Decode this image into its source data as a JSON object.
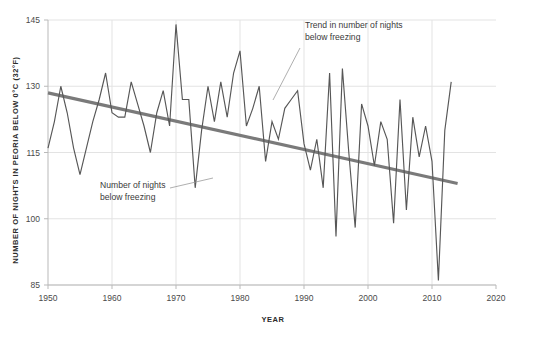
{
  "chart_data": {
    "type": "line",
    "title": "",
    "subtitle": "",
    "xlabel": "YEAR",
    "ylabel": "NUMBER OF NIGHTS IN PEORIA BELOW 0°C (32°F)",
    "xlim": [
      1950,
      2020
    ],
    "ylim": [
      85,
      145
    ],
    "xticks": [
      1950,
      1960,
      1970,
      1980,
      1990,
      2000,
      2010,
      2020
    ],
    "xtick_labels": [
      "1950",
      "1960",
      "1970",
      "1980",
      "1990",
      "2000",
      "2010",
      "2020"
    ],
    "yticks": [
      85,
      100,
      115,
      130,
      145
    ],
    "ytick_labels": [
      "85",
      "100",
      "115",
      "130",
      "145"
    ],
    "grid": "horizontal-and-vertical-light",
    "legend_position": "none",
    "series": [
      {
        "name": "Number of nights below freezing",
        "color": "#575757",
        "x": [
          1950,
          1951,
          1952,
          1953,
          1954,
          1955,
          1956,
          1957,
          1958,
          1959,
          1960,
          1961,
          1962,
          1963,
          1964,
          1965,
          1966,
          1967,
          1968,
          1969,
          1970,
          1971,
          1972,
          1973,
          1974,
          1975,
          1976,
          1977,
          1978,
          1979,
          1980,
          1981,
          1982,
          1983,
          1984,
          1985,
          1986,
          1987,
          1988,
          1989,
          1990,
          1991,
          1992,
          1993,
          1994,
          1995,
          1996,
          1997,
          1998,
          1999,
          2000,
          2001,
          2002,
          2003,
          2004,
          2005,
          2006,
          2007,
          2008,
          2009,
          2010,
          2011,
          2012,
          2013
        ],
        "y": [
          116,
          122,
          130,
          124,
          116,
          110,
          116,
          122,
          127,
          133,
          124,
          123,
          123,
          131,
          126,
          121,
          115,
          124,
          129,
          121,
          144,
          127,
          127,
          107,
          120,
          130,
          122,
          131,
          123,
          133,
          138,
          121,
          125,
          130,
          113,
          122,
          118,
          125,
          127,
          129,
          117,
          111,
          118,
          107,
          133,
          96,
          134,
          115,
          98,
          126,
          121,
          112,
          122,
          118,
          99,
          127,
          102,
          123,
          114,
          121,
          113,
          86,
          120,
          131
        ]
      },
      {
        "name": "Trend in number of nights below freezing",
        "color": "#7a7a7a",
        "type": "trend",
        "x": [
          1950,
          2014
        ],
        "y": [
          128.5,
          108.0
        ]
      }
    ],
    "annotations": [
      {
        "name": "trend-annotation",
        "text_line_1": "Trend in number of nights",
        "text_line_2": "below freezing",
        "text_x": 305,
        "text_y": 28,
        "leader_from_x": 300,
        "leader_from_y": 48,
        "leader_to_x": 273,
        "leader_to_y": 100
      },
      {
        "name": "series-annotation",
        "text_line_1": "Number of nights",
        "text_line_2": "below freezing",
        "text_x": 100,
        "text_y": 188,
        "leader_from_x": 170,
        "leader_from_y": 188,
        "leader_to_x": 213,
        "leader_to_y": 178
      }
    ],
    "colors": {
      "data_line": "#575757",
      "trend_line": "#7a7a7a",
      "gridline": "#e3e3e3",
      "axis": "#b9b9b9",
      "text": "#3a3a3a",
      "background": "#ffffff"
    }
  }
}
